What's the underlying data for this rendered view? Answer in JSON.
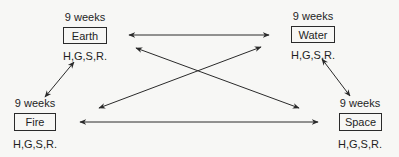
{
  "diagram": {
    "nodes": [
      {
        "id": "earth",
        "label": "Earth",
        "duration": "9 weeks",
        "codes": "H,G,S,R."
      },
      {
        "id": "water",
        "label": "Water",
        "duration": "9 weeks",
        "codes": "H,G,S,R."
      },
      {
        "id": "fire",
        "label": "Fire",
        "duration": "9 weeks",
        "codes": "H,G,S,R."
      },
      {
        "id": "space",
        "label": "Space",
        "duration": "9 weeks",
        "codes": "H,G,S,R."
      }
    ],
    "edges": [
      {
        "from": "earth",
        "to": "water",
        "type": "bidirectional"
      },
      {
        "from": "fire",
        "to": "space",
        "type": "bidirectional"
      },
      {
        "from": "earth",
        "to": "space",
        "type": "bidirectional"
      },
      {
        "from": "fire",
        "to": "water",
        "type": "bidirectional"
      },
      {
        "from": "earth",
        "to": "fire",
        "type": "bidirectional"
      },
      {
        "from": "water",
        "to": "space",
        "type": "bidirectional"
      }
    ],
    "colors": {
      "line": "#2a2a2a",
      "background": "#f7f7f5",
      "text": "#1e1e1e"
    }
  }
}
